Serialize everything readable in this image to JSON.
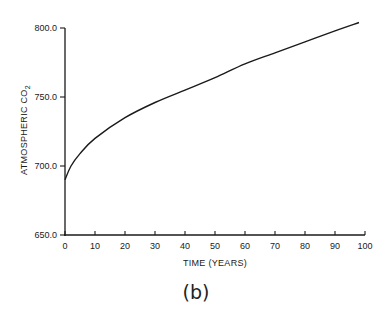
{
  "chart_data": {
    "type": "line",
    "title": "",
    "caption": "(b)",
    "xlabel": "TIME (YEARS)",
    "ylabel": "ATMOSPHERIC CO2",
    "ylabel_main": "ATMOSPHERIC CO",
    "ylabel_sub": "2",
    "xlim": [
      0,
      100
    ],
    "ylim": [
      650,
      800
    ],
    "x_ticks": [
      0,
      10,
      20,
      30,
      40,
      50,
      60,
      70,
      80,
      90,
      100
    ],
    "x_tick_labels": [
      "0",
      "10",
      "20",
      "30",
      "40",
      "50",
      "60",
      "70",
      "80",
      "90",
      "100"
    ],
    "y_ticks": [
      650,
      700,
      750,
      800
    ],
    "y_tick_labels": [
      "650.0",
      "700.0",
      "750.0",
      "800.0"
    ],
    "grid": false,
    "legend": null,
    "series": [
      {
        "name": "Atmospheric CO2",
        "color": "#1a1a1a",
        "x": [
          0,
          2,
          5,
          10,
          20,
          30,
          40,
          50,
          60,
          70,
          80,
          90,
          98
        ],
        "values": [
          690,
          700,
          709,
          720,
          735,
          746,
          755,
          764,
          774,
          782,
          790,
          798,
          804
        ]
      }
    ]
  }
}
